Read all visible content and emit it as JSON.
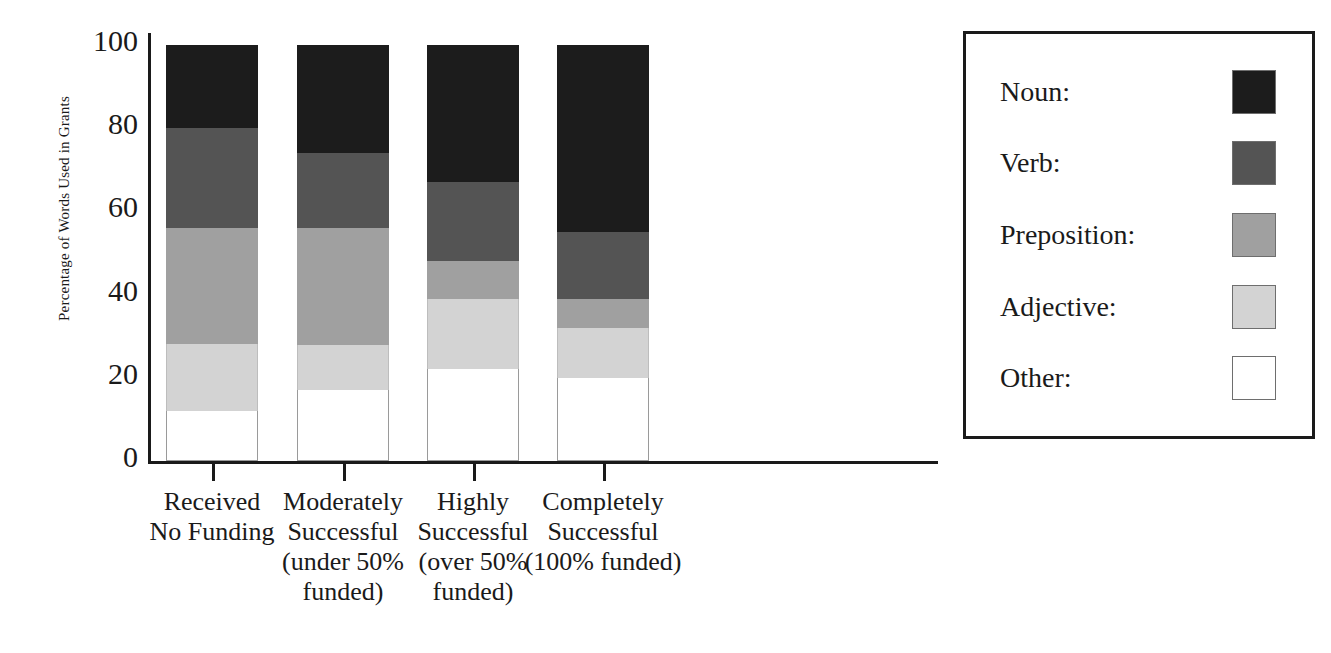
{
  "chart_data": {
    "type": "bar",
    "subtype": "stacked-bar-100-percent",
    "title": "",
    "xlabel": "",
    "ylabel": "Percentage of Words Used in Grants",
    "ylim": [
      0,
      100
    ],
    "yticks": [
      0,
      20,
      40,
      60,
      80,
      100
    ],
    "ytick_labels": [
      "0",
      "20",
      "40",
      "60",
      "80",
      "100"
    ],
    "grid": false,
    "legend_position": "right",
    "stack_order_bottom_to_top": [
      "Other",
      "Adjective",
      "Preposition",
      "Verb",
      "Noun"
    ],
    "categories": [
      "Received No Funding",
      "Moderately Successful (under 50% funded)",
      "Highly Successful (over 50% funded)",
      "Completely Successful (100% funded)"
    ],
    "category_label_lines": [
      [
        "Received",
        "No Funding"
      ],
      [
        "Moderately",
        "Successful",
        "(under 50%",
        "funded)"
      ],
      [
        "Highly",
        "Successful",
        "(over 50%",
        "funded)"
      ],
      [
        "Completely",
        "Successful",
        "(100% funded)"
      ]
    ],
    "series": [
      {
        "name": "Other",
        "color": "#ffffff",
        "values": [
          12,
          17,
          22,
          20
        ]
      },
      {
        "name": "Adjective",
        "color": "#d3d3d3",
        "values": [
          16,
          11,
          17,
          12
        ]
      },
      {
        "name": "Preposition",
        "color": "#a0a0a0",
        "values": [
          28,
          28,
          9,
          7
        ]
      },
      {
        "name": "Verb",
        "color": "#545454",
        "values": [
          24,
          18,
          19,
          16
        ]
      },
      {
        "name": "Noun",
        "color": "#1c1c1c",
        "values": [
          20,
          26,
          33,
          45
        ]
      }
    ],
    "cumulative_tops": [
      [
        12,
        28,
        56,
        80,
        100
      ],
      [
        17,
        28,
        56,
        74,
        100
      ],
      [
        22,
        39,
        48,
        67,
        100
      ],
      [
        20,
        32,
        39,
        55,
        100
      ]
    ]
  },
  "legend": {
    "items": [
      {
        "label": "Noun:",
        "color": "#1c1c1c"
      },
      {
        "label": "Verb:",
        "color": "#545454"
      },
      {
        "label": "Preposition:",
        "color": "#a0a0a0"
      },
      {
        "label": "Adjective:",
        "color": "#d3d3d3"
      },
      {
        "label": "Other:",
        "color": "#ffffff"
      }
    ]
  },
  "colors": {
    "axis": "#1a1a1a",
    "background": "#ffffff",
    "noun": "#1c1c1c",
    "verb": "#545454",
    "preposition": "#a0a0a0",
    "adjective": "#d3d3d3",
    "other": "#ffffff"
  }
}
